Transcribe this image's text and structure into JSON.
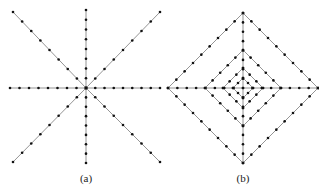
{
  "panels": [
    {
      "id": "a",
      "label": "(a)",
      "description": "Eight-direction star of sample lines through a center point",
      "center": [
        86,
        88
      ],
      "endpoints": [
        [
          13,
          12
        ],
        [
          86,
          10
        ],
        [
          160,
          12
        ],
        [
          160,
          88
        ],
        [
          160,
          162
        ],
        [
          86,
          163
        ],
        [
          13,
          162
        ],
        [
          10,
          88
        ]
      ],
      "dots_per_ray": 8
    },
    {
      "id": "b",
      "label": "(b)",
      "description": "Concentric diamonds with horizontal and vertical axes",
      "center": [
        243,
        88
      ],
      "diamond_radii": [
        75,
        38,
        20,
        10
      ],
      "dots_per_side": [
        9,
        5,
        3,
        2
      ]
    }
  ],
  "colors": {
    "line": "#888888",
    "dot": "#111111",
    "background": "#ffffff"
  }
}
